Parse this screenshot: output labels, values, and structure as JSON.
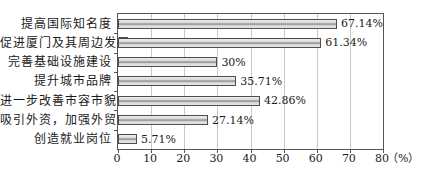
{
  "chart_data": {
    "type": "bar",
    "orientation": "horizontal",
    "title": "",
    "xlabel": "",
    "ylabel": "",
    "categories": [
      "提高国际知名度",
      "促进厦门及其周边发展",
      "完善基础设施建设",
      "提升城市品牌",
      "进一步改善市容市貌",
      "吸引外资，加强外贸",
      "创造就业岗位"
    ],
    "values": [
      67.14,
      61.34,
      30,
      35.71,
      42.86,
      27.14,
      5.71
    ],
    "value_labels": [
      "67.14%",
      "61.34%",
      "30%",
      "35.71%",
      "42.86%",
      "27.14%",
      "5.71%"
    ],
    "xlim": [
      0,
      80
    ],
    "x_ticks": [
      "0",
      "10",
      "20",
      "30",
      "40",
      "50",
      "60",
      "70",
      "80"
    ],
    "x_unit": "（%）",
    "grid": "vertical",
    "legend": "none",
    "colors": {
      "bar_fill": "#d9d9d9",
      "bar_stripe": "#a0a0a0",
      "bar_border": "#4d4d4d",
      "gridline": "#c9c9c9",
      "axis": "#555555",
      "background": "#ffffff"
    }
  }
}
